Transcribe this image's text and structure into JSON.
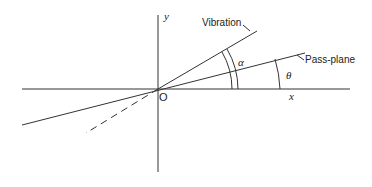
{
  "diagram": {
    "axes": {
      "x_label": "x",
      "y_label": "y",
      "origin_label": "O"
    },
    "lines": [
      {
        "name": "vibration",
        "label": "Vibration"
      },
      {
        "name": "pass-plane",
        "label": "Pass-plane"
      }
    ],
    "angles": [
      {
        "name": "alpha",
        "symbol": "α",
        "between": "vibration and pass-plane"
      },
      {
        "name": "theta",
        "symbol": "θ",
        "between": "pass-plane and x-axis"
      }
    ],
    "stroke_color": "#333333"
  }
}
